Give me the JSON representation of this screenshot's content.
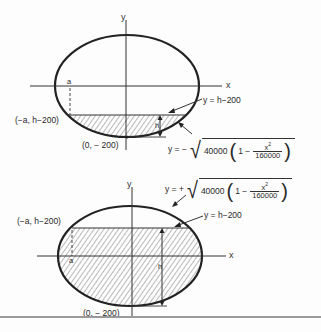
{
  "figure": {
    "top_diagram": {
      "axis_labels": {
        "x": "x",
        "y": "y"
      },
      "segment_label": "a",
      "height_label": "h",
      "point_left": "(−a, h−200)",
      "point_bottom": "(0, − 200)",
      "line_eq": "y  =  h−200",
      "curve_eq": {
        "prefix": "y  =  −",
        "radicand_const": "40000",
        "one_minus": "1 −",
        "frac_num": "x",
        "frac_num_exp": "2",
        "frac_den": "160000"
      },
      "shading": "below chord (cap segment)"
    },
    "bottom_diagram": {
      "axis_labels": {
        "x": "x",
        "y": "y"
      },
      "segment_label": "a",
      "height_label": "h",
      "point_left": "(−a, h−200)",
      "point_bottom": "(0, − 200)",
      "line_eq": "y  =  h−200",
      "curve_eq": {
        "prefix": "y  =  +",
        "radicand_const": "40000",
        "one_minus": "1 −",
        "frac_num": "x",
        "frac_num_exp": "2",
        "frac_den": "160000"
      },
      "shading": "below chord (major segment)"
    },
    "colors": {
      "ink": "#2a2a2a",
      "background": "#fdfdfd",
      "rule": "#9a9a9a"
    }
  }
}
